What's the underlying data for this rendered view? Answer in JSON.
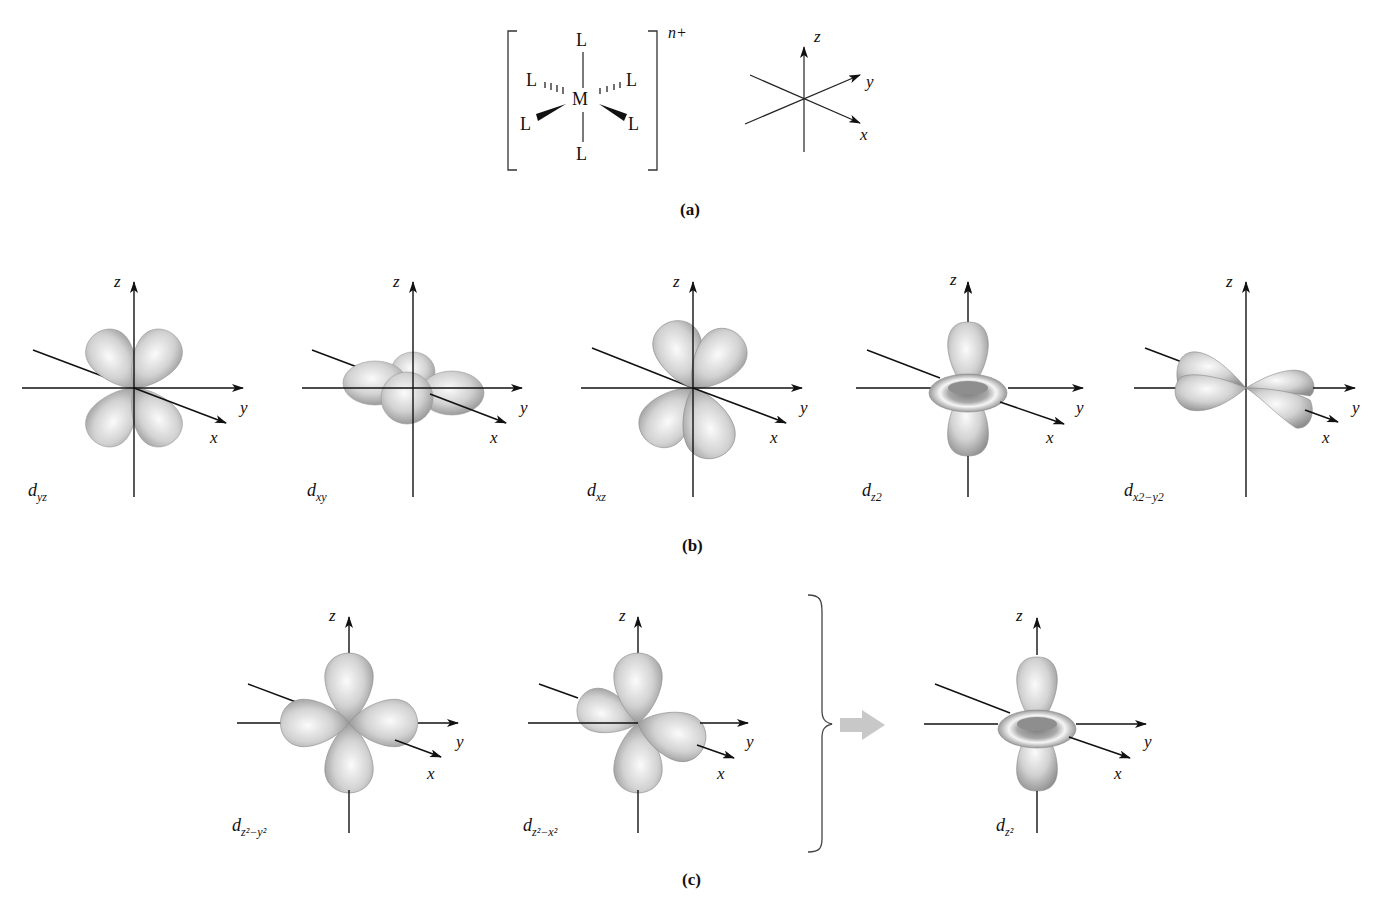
{
  "panel_a": {
    "caption": "(a)",
    "complex": {
      "metal": "M",
      "ligand": "L",
      "charge": "n+"
    },
    "axes": {
      "x": "x",
      "y": "y",
      "z": "z"
    }
  },
  "panel_b": {
    "caption": "(b)",
    "orbitals": [
      {
        "name": "d",
        "sub": "yz",
        "sup": ""
      },
      {
        "name": "d",
        "sub": "xy",
        "sup": ""
      },
      {
        "name": "d",
        "sub": "xz",
        "sup": ""
      },
      {
        "name": "d",
        "sub": "z2",
        "sup": ""
      },
      {
        "name": "d",
        "sub": "x2−y2",
        "sup": ""
      }
    ],
    "axes": {
      "x": "x",
      "y": "y",
      "z": "z"
    }
  },
  "panel_c": {
    "caption": "(c)",
    "orbitals": [
      {
        "name": "d",
        "sub": "z²−y²"
      },
      {
        "name": "d",
        "sub": "z²−x²"
      },
      {
        "name": "d",
        "sub": "z²"
      }
    ],
    "axes": {
      "x": "x",
      "y": "y",
      "z": "z"
    }
  },
  "colors": {
    "lobe_light": "#f4f4f4",
    "lobe_mid": "#c8c8c8",
    "lobe_dark": "#8e8e8e",
    "arrow_gray": "#c8c8c8",
    "line": "#111111"
  }
}
